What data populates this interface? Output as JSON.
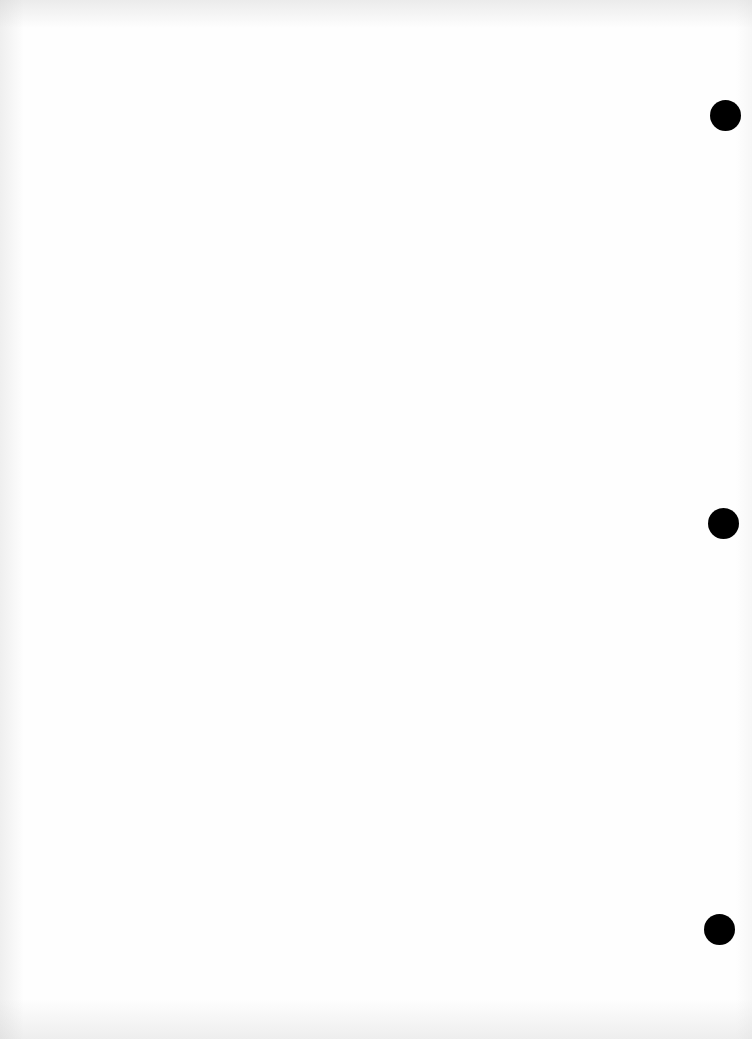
{
  "document": {
    "type": "scanned blank page",
    "background_color": "#fefefe",
    "ghost_text_lines": [
      "",
      "",
      ""
    ],
    "punch_holes": [
      {
        "name": "punch-hole-top",
        "cx": 725,
        "cy": 115
      },
      {
        "name": "punch-hole-middle",
        "cx": 723,
        "cy": 523
      },
      {
        "name": "punch-hole-bottom",
        "cx": 719,
        "cy": 929
      }
    ],
    "hole_color": "#000000"
  }
}
